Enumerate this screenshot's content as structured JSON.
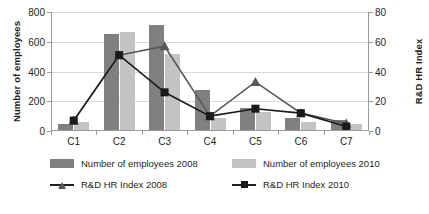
{
  "chart_data": {
    "type": "bar",
    "title": "",
    "categories": [
      "C1",
      "C2",
      "C3",
      "C4",
      "C5",
      "C6",
      "C7"
    ],
    "grid": true,
    "legend_position": "bottom",
    "axes": {
      "left": {
        "label": "Number of employees",
        "min": 0,
        "max": 800,
        "step": 200,
        "ticks": [
          0,
          200,
          400,
          600,
          800
        ]
      },
      "right": {
        "label": "R&D HR Index",
        "min": 0,
        "max": 80,
        "step": 20,
        "ticks": [
          0,
          20,
          40,
          60,
          80
        ]
      }
    },
    "series": [
      {
        "name": "Number of employees 2008",
        "kind": "bar",
        "axis": "left",
        "color": "#808080",
        "values": [
          45,
          650,
          715,
          275,
          155,
          85,
          75
        ]
      },
      {
        "name": "Number of employees 2010",
        "kind": "bar",
        "axis": "left",
        "color": "#c3c3c3",
        "values": [
          60,
          665,
          520,
          90,
          125,
          60,
          45
        ]
      },
      {
        "name": "R&D HR Index 2008",
        "kind": "line",
        "axis": "right",
        "color": "#595959",
        "marker": "triangle",
        "values": [
          7,
          51,
          57,
          10,
          33,
          12,
          5
        ]
      },
      {
        "name": "R&D HR Index 2010",
        "kind": "line",
        "axis": "right",
        "color": "#1a1a1a",
        "marker": "square",
        "values": [
          7,
          51,
          26,
          10,
          15,
          12,
          3
        ]
      }
    ]
  },
  "legend": {
    "items": [
      {
        "label": "Number of employees 2008",
        "key": "swatch-dark"
      },
      {
        "label": "Number of employees 2010",
        "key": "swatch-light"
      },
      {
        "label": "R&D HR Index 2008",
        "key": "line-triangle"
      },
      {
        "label": "R&D HR Index 2010",
        "key": "line-square"
      }
    ]
  }
}
